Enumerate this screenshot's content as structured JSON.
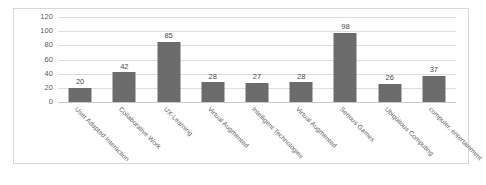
{
  "chart_data": {
    "type": "bar",
    "title": "",
    "xlabel": "",
    "ylabel": "",
    "ylim": [
      0,
      120
    ],
    "yticks": [
      0,
      20,
      40,
      60,
      80,
      100,
      120
    ],
    "grid": true,
    "legend": "none",
    "bar_color": "#6b6b6b",
    "gridline_color": "#dedede",
    "categories": [
      "User Adapted Interaction",
      "Collaborative Work",
      "UX-Learning",
      "Virtual Augmented",
      "Intelligent Technologies",
      "Virtual Augmented",
      "Serious Games",
      "Ubiquitous Computing",
      "computer, entertainment"
    ],
    "values": [
      20,
      42,
      85,
      28,
      27,
      28,
      98,
      26,
      37
    ],
    "data_labels": [
      "20",
      "42",
      "85",
      "28",
      "27",
      "28",
      "98",
      "26",
      "37"
    ]
  }
}
